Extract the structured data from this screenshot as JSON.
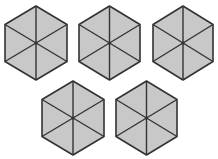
{
  "diagram": {
    "fill_color": "#c8c8c8",
    "stroke_color": "#333333",
    "background": "#ffffff",
    "rows": [
      {
        "count": 3
      },
      {
        "count": 2
      }
    ],
    "hexagons": [
      {
        "id": "hex-1",
        "cx": 36,
        "cy": 43,
        "rx": 31,
        "ry": 37,
        "sections": 6
      },
      {
        "id": "hex-2",
        "cx": 109.5,
        "cy": 43,
        "rx": 30.5,
        "ry": 37,
        "sections": 6
      },
      {
        "id": "hex-3",
        "cx": 183,
        "cy": 43,
        "rx": 30,
        "ry": 37,
        "sections": 6
      },
      {
        "id": "hex-4",
        "cx": 73,
        "cy": 118,
        "rx": 31,
        "ry": 37,
        "sections": 6
      },
      {
        "id": "hex-5",
        "cx": 146.5,
        "cy": 118,
        "rx": 30.5,
        "ry": 37,
        "sections": 6
      }
    ]
  }
}
